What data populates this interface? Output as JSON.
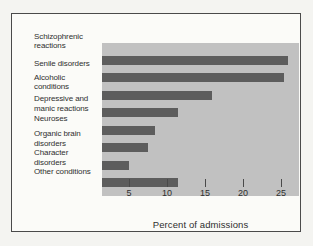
{
  "figure": {
    "background": "#f4f4f1",
    "panel_background": "#fbfbf8",
    "plot_background": "#c1c1c1",
    "bar_color": "#5d5d5d",
    "text_color": "#2f2f2f",
    "border_color": "#4a4a4a"
  },
  "chart_data": {
    "type": "bar",
    "orientation": "horizontal",
    "title": "",
    "xlabel": "Percent of admissions",
    "ylabel": "",
    "categories": [
      "Schizophrenic reactions",
      "Senile disorders",
      "Alcoholic conditions",
      "Depressive and manic reactions",
      "Neuroses",
      "Organic brain disorders",
      "Character disorders",
      "Other conditions"
    ],
    "category_label_lines": [
      [
        "Schizophrenic",
        "reactions"
      ],
      [
        "Senile disorders"
      ],
      [
        "Alcoholic",
        "conditions"
      ],
      [
        "Depressive and",
        "manic reactions"
      ],
      [
        "Neuroses"
      ],
      [
        "Organic brain",
        "disorders"
      ],
      [
        "Character",
        "disorders"
      ],
      [
        "Other conditions"
      ]
    ],
    "values": [
      24.5,
      24,
      14.5,
      10,
      7,
      6,
      3.5,
      10
    ],
    "x_ticks": [
      5,
      10,
      15,
      20,
      25
    ],
    "xlim": [
      0,
      26
    ],
    "grid": false,
    "legend_position": "none"
  }
}
